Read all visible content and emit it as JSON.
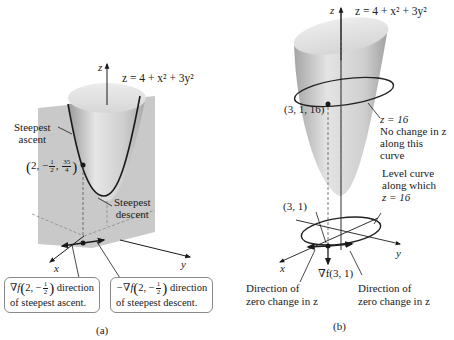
{
  "panel_a": {
    "axis_z_label": "z",
    "axis_x_label": "x",
    "axis_y_label": "y",
    "surface_equation": "z = 4 + x² + 3y²",
    "steepest_ascent_label": "Steepest\nascent",
    "steepest_ascent_line1": "Steepest",
    "steepest_ascent_line2": "ascent",
    "steepest_descent_line1": "Steepest",
    "steepest_descent_line2": "descent",
    "point": {
      "open_paren": "(",
      "x": "2,",
      "y_sign": "−",
      "y_num": "1",
      "y_den": "2",
      "z_num": "35",
      "z_den": "4",
      "close_paren": ")"
    },
    "box_ascent": {
      "line1_prefix": "∇f",
      "line1_point_x": "2, −",
      "frac_num": "1",
      "frac_den": "2",
      "line1_suffix": " direction",
      "line2": "of steepest ascent."
    },
    "box_descent": {
      "line1_prefix": "−∇f",
      "line1_point_x": "2, −",
      "frac_num": "1",
      "frac_den": "2",
      "line1_suffix": " direction",
      "line2": "of steepest descent."
    },
    "caption": "(a)"
  },
  "panel_b": {
    "axis_z_label": "z",
    "axis_x_label": "x",
    "axis_y_label": "y",
    "surface_equation": "z = 4 + x² + 3y²",
    "point_3d_label": "(3, 1, 16)",
    "level_z_label": "z = 16",
    "no_change_line1": "No change in z",
    "no_change_line2": "along this",
    "no_change_line3": "curve",
    "level_curve_line1": "Level curve",
    "level_curve_line2": "along which",
    "level_curve_line3": "z = 16",
    "point_2d_label": "(3, 1)",
    "gradient_label": "∇f(3, 1)",
    "zero_change_left_line1": "Direction of",
    "zero_change_left_line2": "zero change in z",
    "zero_change_right_line1": "Direction of",
    "zero_change_right_line2": "zero change in z",
    "caption": "(b)"
  },
  "colors": {
    "plane": "#c9c9c9",
    "surface_light": "#e2e2e2",
    "surface_dark": "#8e8e8e",
    "curve": "#1a1a1a",
    "box_border": "#8a8a8a"
  }
}
